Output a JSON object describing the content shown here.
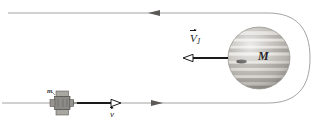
{
  "figure": {
    "kind": "physics-diagram",
    "background_color": "#ffffff",
    "width": 316,
    "height": 125
  },
  "labels": {
    "planet_mass": "M",
    "craft_mass": "m",
    "planet_velocity_symbol": "V",
    "planet_velocity_subscript": "J",
    "craft_velocity_symbol": "v"
  },
  "planet": {
    "name": "jupiter-like-planet",
    "center_x": 259,
    "center_y": 58,
    "radius": 31,
    "body_color": "#cfcdc8",
    "band_light": "#e2e0dc",
    "band_dark": "#b4b1ab",
    "spot_color": "#3c3a38",
    "outline_color": "#9a9892"
  },
  "trajectory": {
    "name": "hyperbolic-flyby-path",
    "stroke_color": "#8e8c88",
    "stroke_width": 0.8,
    "top_line_y": 13,
    "bottom_line_y": 103,
    "turn_right_x": 300,
    "top_arrow_x": 157,
    "top_arrow_direction": "left",
    "bottom_arrow_x": 155,
    "bottom_arrow_direction": "right"
  },
  "vectors": {
    "planet_velocity": {
      "name": "planet-velocity-arrow",
      "color": "#1a1a1a",
      "from_x": 228,
      "to_x": 186,
      "y": 58,
      "direction": "left",
      "head_style": "hollow"
    },
    "craft_velocity": {
      "name": "craft-velocity-arrow",
      "color": "#1a1a1a",
      "from_x": 77,
      "to_x": 118,
      "y": 103,
      "direction": "right",
      "head_style": "hollow"
    }
  },
  "spacecraft": {
    "name": "spacecraft",
    "center_x": 62,
    "center_y": 103,
    "body_color": "#8d8b87",
    "panel_color": "#a9a7a2",
    "outline_color": "#5d5b58"
  },
  "colors": {
    "ink": "#1a1a1a",
    "path": "#8e8c88",
    "planet_base": "#cfcdc8"
  }
}
